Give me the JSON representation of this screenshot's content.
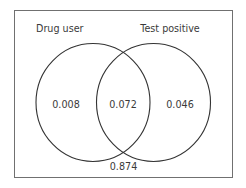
{
  "diagram": {
    "type": "venn",
    "sets": [
      {
        "label": "Drug user"
      },
      {
        "label": "Test positive"
      }
    ],
    "regions": {
      "drug_user_only": "0.008",
      "both": "0.072",
      "test_positive_only": "0.046",
      "neither": "0.874"
    },
    "colors": {
      "frame": "#707070",
      "circle": "#333333",
      "text": "#3a3a3a"
    }
  }
}
